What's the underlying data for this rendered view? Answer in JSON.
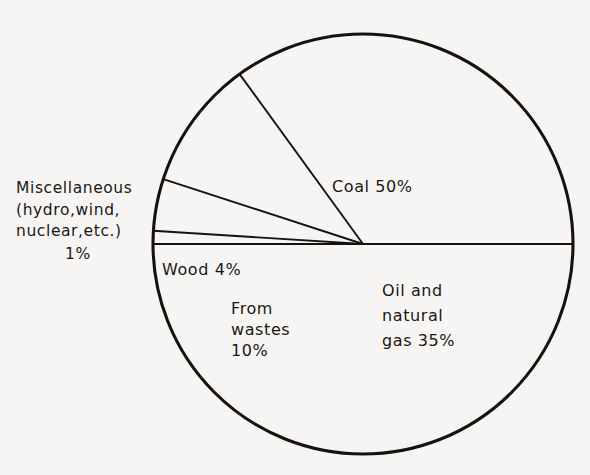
{
  "figure": {
    "background_color": "#f6f5f3",
    "ink_color": "#16120f"
  },
  "chart_data": {
    "type": "pie",
    "title": "",
    "subtitle": "",
    "xlabel": "",
    "ylabel": "",
    "grid": false,
    "legend_position": "none",
    "labels_inside_slices": true,
    "units": "percent",
    "total": 100,
    "categories": [
      "Coal",
      "Oil and natural gas",
      "From wastes",
      "Wood",
      "Miscellaneous (hydro, wind, nuclear, etc.)"
    ],
    "values": [
      50,
      35,
      10,
      4,
      1
    ],
    "slices": [
      {
        "name": "Coal",
        "value": 50,
        "label_text": "Coal 50%",
        "value_text": "50%",
        "start_angle_deg": 180,
        "sweep_deg": 180,
        "fill": "none"
      },
      {
        "name": "Oil and natural gas",
        "value": 35,
        "label_text": "Oil and natural gas 35%",
        "label_lines": [
          "Oil and",
          "natural",
          "gas 35%"
        ],
        "value_text": "35%",
        "start_angle_deg": 0,
        "sweep_deg": 126,
        "fill": "none"
      },
      {
        "name": "From wastes",
        "value": 10,
        "label_text": "From wastes 10%",
        "label_lines": [
          "From",
          "wastes",
          "10%"
        ],
        "value_text": "10%",
        "start_angle_deg": 126,
        "sweep_deg": 36,
        "fill": "none"
      },
      {
        "name": "Wood",
        "value": 4,
        "label_text": "Wood 4%",
        "value_text": "4%",
        "start_angle_deg": 162,
        "sweep_deg": 14.4,
        "fill": "none"
      },
      {
        "name": "Miscellaneous",
        "value": 1,
        "label_text": "Miscellaneous (hydro,wind, nuclear,etc.) 1%",
        "label_lines": [
          "Miscellaneous",
          "(hydro,wind,",
          "nuclear,etc.)"
        ],
        "value_text": "1%",
        "start_angle_deg": 176.4,
        "sweep_deg": 3.6,
        "fill": "none"
      }
    ]
  },
  "labels": {
    "coal": "Coal 50%",
    "wood": "Wood 4%",
    "wastes_line1": "From",
    "wastes_line2": "wastes",
    "wastes_line3": "10%",
    "oil_line1": "Oil and",
    "oil_line2": "natural",
    "oil_line3": "gas 35%",
    "misc_line1": "Miscellaneous",
    "misc_line2": "(hydro,wind,",
    "misc_line3": "nuclear,etc.)",
    "misc_line4": "1%"
  }
}
